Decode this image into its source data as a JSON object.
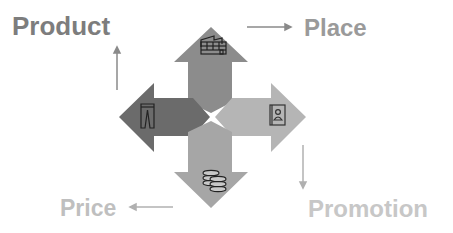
{
  "diagram": {
    "labels": {
      "product": "Product",
      "place": "Place",
      "price": "Price",
      "promotion": "Promotion"
    },
    "arrows": [
      {
        "direction": "up",
        "name": "Place",
        "icon": "warehouse-icon",
        "color": "#8c8c8c"
      },
      {
        "direction": "left",
        "name": "Product",
        "icon": "trousers-icon",
        "color": "#6b6b6b"
      },
      {
        "direction": "right",
        "name": "Promotion",
        "icon": "address-book-icon",
        "color": "#b5b5b5"
      },
      {
        "direction": "down",
        "name": "Price",
        "icon": "coins-icon",
        "color": "#a6a6a6"
      }
    ],
    "flow": [
      "Product",
      "Place",
      "Promotion",
      "Price"
    ],
    "colors": {
      "product_text": "#7d7d7d",
      "place_text": "#9a9a9a",
      "price_text": "#bfbfbf",
      "promotion_text": "#c7c7c7",
      "connector": "#8a8a8a"
    }
  }
}
